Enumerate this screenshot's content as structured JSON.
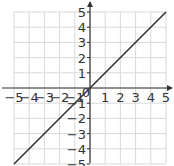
{
  "chart_data": {
    "type": "line",
    "title": "",
    "xlabel": "",
    "ylabel": "",
    "xlim": [
      -5,
      5
    ],
    "ylim": [
      -5,
      5
    ],
    "grid": true,
    "x_ticks": [
      "−5",
      "−4",
      "−3",
      "−2",
      "−1",
      "0",
      "1",
      "2",
      "3",
      "4",
      "5"
    ],
    "y_ticks": [
      "5",
      "4",
      "3",
      "2",
      "1",
      "−1",
      "−2",
      "−3",
      "−4",
      "−5"
    ],
    "series": [
      {
        "name": "y = x",
        "x": [
          -5,
          5
        ],
        "y": [
          -5,
          5
        ],
        "color": "#333333"
      }
    ]
  },
  "colors": {
    "grid": "#d9d9d9",
    "axis": "#333333",
    "line": "#333333"
  }
}
